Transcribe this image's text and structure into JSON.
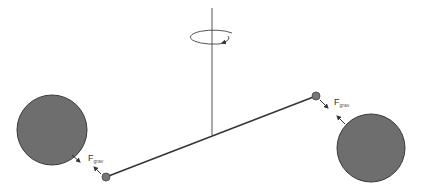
{
  "diagram": {
    "colors": {
      "background": "#ffffff",
      "large_mass_fill": "#6e6e6e",
      "large_mass_stroke": "#3a3a3a",
      "small_mass_fill": "#777777",
      "line": "#333333",
      "axis": "#555555"
    },
    "axis": {
      "x": 212,
      "y_top": 8,
      "y_bottom": 135
    },
    "rotation_arrow": {
      "cx": 212,
      "cy": 37,
      "rx": 23,
      "ry": 7,
      "icon": "rotation-arrow-icon"
    },
    "rod": {
      "x1": 106,
      "y1": 177,
      "x2": 316,
      "y2": 96
    },
    "large_masses": [
      {
        "name": "large-mass-left",
        "cx": 52,
        "cy": 130,
        "r": 35
      },
      {
        "name": "large-mass-right",
        "cx": 371,
        "cy": 148,
        "r": 34
      }
    ],
    "small_masses": [
      {
        "name": "small-mass-left",
        "cx": 106,
        "cy": 177,
        "r": 4
      },
      {
        "name": "small-mass-right",
        "cx": 316,
        "cy": 96,
        "r": 4
      }
    ],
    "force_labels": [
      {
        "main": "F",
        "sub": "grav",
        "x": 88,
        "y": 160
      },
      {
        "main": "F",
        "sub": "grav",
        "x": 334,
        "y": 104
      }
    ]
  }
}
